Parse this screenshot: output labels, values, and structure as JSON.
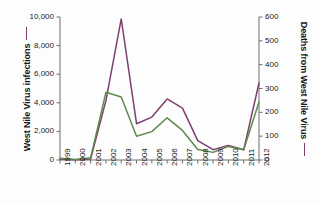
{
  "chart_data": {
    "type": "line",
    "title": "",
    "xlabel": "",
    "categories": [
      "1999",
      "2000",
      "2001",
      "2002",
      "2003",
      "2004",
      "2005",
      "2006",
      "2007",
      "2008",
      "2009",
      "2010",
      "2011",
      "2012"
    ],
    "grid": false,
    "legend_position": "axis-titles",
    "axes": {
      "left": {
        "label": "West Nile Virus infections",
        "ticks": [
          "0",
          "2,000",
          "4,000",
          "6,000",
          "8,000",
          "10,000"
        ],
        "tick_values": [
          0,
          2000,
          4000,
          6000,
          8000,
          10000
        ],
        "ylim": [
          0,
          10000
        ]
      },
      "right": {
        "label": "Deaths from West Nile Virus",
        "ticks": [
          "0",
          "100",
          "200",
          "300",
          "400",
          "500",
          "600"
        ],
        "tick_values": [
          0,
          100,
          200,
          300,
          400,
          500,
          600
        ],
        "ylim": [
          0,
          600
        ]
      }
    },
    "series": [
      {
        "name": "West Nile Virus infections",
        "axis": "left",
        "color": "#7d3f6d",
        "values": [
          62,
          21,
          66,
          4156,
          9862,
          2539,
          3000,
          4269,
          3630,
          1356,
          720,
          1021,
          712,
          5387
        ]
      },
      {
        "name": "Deaths from West Nile Virus",
        "axis": "right",
        "color": "#5f8a4e",
        "values": [
          7,
          2,
          9,
          284,
          264,
          100,
          119,
          177,
          124,
          44,
          32,
          57,
          43,
          243
        ]
      }
    ]
  }
}
